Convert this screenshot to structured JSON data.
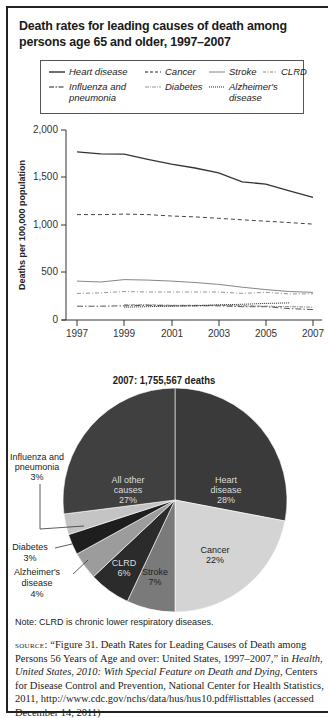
{
  "title": "Death rates for leading causes of death among persons age 65 and older, 1997–2007",
  "legend": [
    {
      "name": "Heart disease",
      "style": "solid"
    },
    {
      "name": "Cancer",
      "style": "dashed"
    },
    {
      "name": "Stroke",
      "style": "solid-thin"
    },
    {
      "name": "CLRD",
      "style": "dash-dot"
    },
    {
      "name": "Influenza and pneumonia",
      "style": "long-dash-dot"
    },
    {
      "name": "Diabetes",
      "style": "dash-dot-light"
    },
    {
      "name": "Alzheimer's disease",
      "style": "dotted"
    }
  ],
  "chart_data": [
    {
      "type": "line",
      "title": "Death rates for leading causes of death among persons age 65 and older, 1997–2007",
      "xlabel": "Year",
      "ylabel": "Deaths per 100,000 population",
      "x": [
        1997,
        1998,
        1999,
        2000,
        2001,
        2002,
        2003,
        2004,
        2005,
        2006,
        2007
      ],
      "x_ticks": [
        "1997",
        "1999",
        "2001",
        "2003",
        "2005",
        "2007"
      ],
      "y_ticks": [
        "0",
        "500",
        "1,000",
        "1,500",
        "2,000"
      ],
      "ylim": [
        0,
        2000
      ],
      "grid": false,
      "legend_position": "top",
      "series": [
        {
          "name": "Heart disease",
          "values": [
            1770,
            1750,
            1745,
            1690,
            1640,
            1600,
            1550,
            1455,
            1430,
            1360,
            1290
          ]
        },
        {
          "name": "Cancer",
          "values": [
            1110,
            1110,
            1115,
            1110,
            1095,
            1085,
            1070,
            1055,
            1040,
            1025,
            1010
          ]
        },
        {
          "name": "Stroke",
          "values": [
            410,
            400,
            425,
            420,
            410,
            395,
            375,
            345,
            320,
            300,
            290
          ]
        },
        {
          "name": "CLRD",
          "values": [
            280,
            285,
            300,
            295,
            295,
            295,
            295,
            280,
            290,
            275,
            275
          ]
        },
        {
          "name": "Influenza and pneumonia",
          "values": [
            145,
            145,
            150,
            155,
            150,
            150,
            150,
            140,
            140,
            120,
            110
          ]
        },
        {
          "name": "Diabetes",
          "values": [
            null,
            null,
            160,
            160,
            155,
            155,
            155,
            150,
            145,
            140,
            135
          ]
        },
        {
          "name": "Alzheimer's disease",
          "values": [
            null,
            null,
            135,
            140,
            145,
            150,
            160,
            165,
            175,
            180,
            null
          ]
        }
      ]
    },
    {
      "type": "pie",
      "title": "2007: 1,755,567 deaths",
      "categories": [
        "Heart disease",
        "Cancer",
        "Stroke",
        "CLRD",
        "Alzheimer's disease",
        "Diabetes",
        "Influenza and pneumonia",
        "All other causes"
      ],
      "values": [
        28,
        22,
        7,
        6,
        4,
        3,
        3,
        27
      ],
      "labels": [
        "Heart disease 28%",
        "Cancer 22%",
        "Stroke 7%",
        "CLRD 6%",
        "Alzheimer's disease 4%",
        "Diabetes 3%",
        "Influenza and pneumonia 3%",
        "All other causes 27%"
      ]
    }
  ],
  "pie_labels": {
    "heart": [
      "Heart",
      "disease",
      "28%"
    ],
    "cancer": [
      "Cancer",
      "22%"
    ],
    "stroke": [
      "Stroke",
      "7%"
    ],
    "clrd": [
      "CLRD",
      "6%"
    ],
    "alz": [
      "Alzheimer's",
      "disease",
      "4%"
    ],
    "diabetes": [
      "Diabetes",
      "3%"
    ],
    "flu": [
      "Influenza and",
      "pneumonia",
      "3%"
    ],
    "other": [
      "All other",
      "causes",
      "27%"
    ]
  },
  "axis": {
    "ylabel": "Deaths per 100,000 population",
    "xlabel": "Year",
    "yticks": [
      "2,000",
      "1,500",
      "1,000",
      "500",
      "0"
    ],
    "xticks": [
      "1997",
      "1999",
      "2001",
      "2003",
      "2005",
      "2007"
    ]
  },
  "colors": {
    "heart": "#3a3a3a",
    "cancer": "#d4d4d4",
    "stroke": "#7a7a7a",
    "clrd": "#2b2b2b",
    "alz": "#9c9c9c",
    "diabetes": "#1e1e1e",
    "flu": "#c4c4c4",
    "other": "#404040"
  },
  "note": "Note: CLRD is chronic lower respiratory diseases.",
  "source": {
    "label": "source:",
    "part1": " “Figure 31. Death Rates for Leading Causes of Death among Persons 56 Years of Age and over: United States, 1997–2007,” in ",
    "italic": "Health, United States, 2010: With Special Feature on Death and Dying",
    "part2": ", Centers for Disease Control and Prevention, National Center for Health Statistics, 2011, http://www.cdc.gov/nchs/data/hus/hus10.pdf#listtables (accessed December 14, 2011)"
  }
}
